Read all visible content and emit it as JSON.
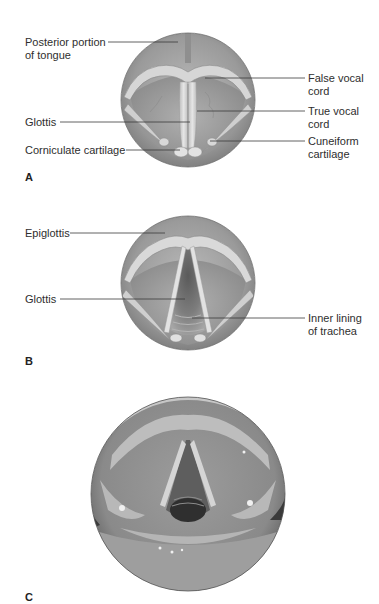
{
  "figure": {
    "panels": [
      {
        "id": "A",
        "letter": "A",
        "type": "illustration",
        "subject": "larynx viewed from above (vocal cords closed)",
        "labels": [
          {
            "line1": "Posterior portion",
            "line2": "of tongue",
            "side": "left"
          },
          {
            "line1": "False vocal",
            "line2": "cord",
            "side": "right"
          },
          {
            "line1": "Glottis",
            "line2": "",
            "side": "left"
          },
          {
            "line1": "True vocal",
            "line2": "cord",
            "side": "right"
          },
          {
            "line1": "Corniculate cartilage",
            "line2": "",
            "side": "left"
          },
          {
            "line1": "Cuneiform",
            "line2": "cartilage",
            "side": "right"
          }
        ]
      },
      {
        "id": "B",
        "letter": "B",
        "type": "illustration",
        "subject": "larynx viewed from above (vocal cords open)",
        "labels": [
          {
            "line1": "Epiglottis",
            "line2": "",
            "side": "left"
          },
          {
            "line1": "Glottis",
            "line2": "",
            "side": "left"
          },
          {
            "line1": "Inner lining",
            "line2": "of trachea",
            "side": "right"
          }
        ]
      },
      {
        "id": "C",
        "letter": "C",
        "type": "photograph",
        "subject": "laryngoscopic photo of vocal cords",
        "labels": []
      }
    ],
    "colors": {
      "background": "#ffffff",
      "text": "#2e2e2e",
      "leader_line": "#3a3a3a",
      "illustration_dark": "#7a7a7a",
      "illustration_mid": "#a8a8a8",
      "illustration_light": "#d8d8d8"
    }
  }
}
